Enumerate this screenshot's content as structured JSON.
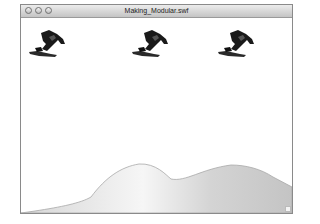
{
  "window": {
    "title": "Making_Modular.swf",
    "buttons": [
      "close",
      "minimize",
      "zoom"
    ]
  },
  "stage": {
    "background": "#ffffff",
    "sprites": [
      {
        "name": "snowboarder",
        "x": 7,
        "y": 12
      },
      {
        "name": "snowboarder",
        "x": 110,
        "y": 12
      },
      {
        "name": "snowboarder",
        "x": 196,
        "y": 12
      }
    ],
    "terrain_fill": "#d8d8d8"
  }
}
